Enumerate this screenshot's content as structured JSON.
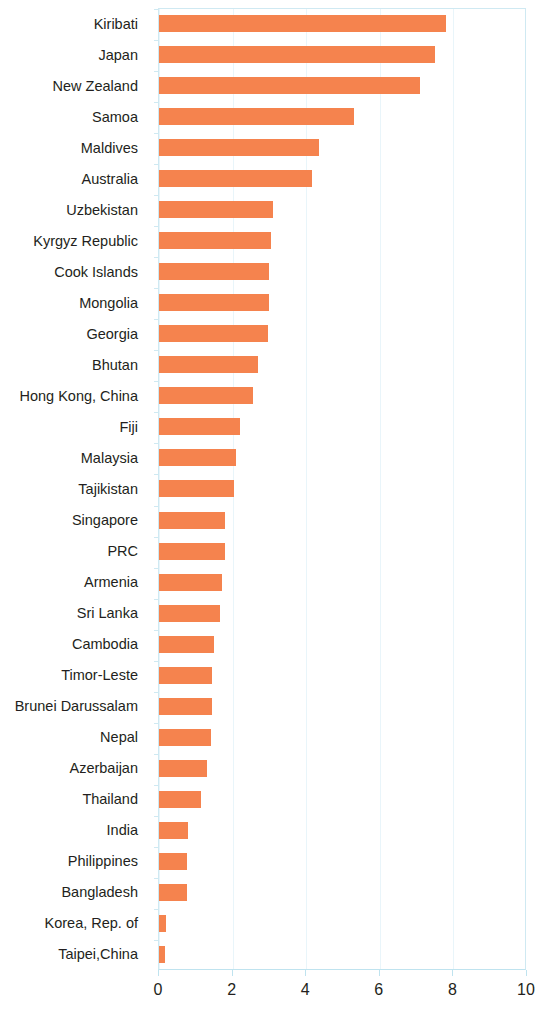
{
  "chart_data": {
    "type": "bar",
    "orientation": "horizontal",
    "title": "",
    "subtitle": "",
    "xlabel": "",
    "ylabel": "",
    "xlim": [
      0,
      10
    ],
    "ylim": null,
    "grid": true,
    "legend": null,
    "xticks": [
      "0",
      "2",
      "4",
      "6",
      "8",
      "10"
    ],
    "xtick_values": [
      0,
      2,
      4,
      6,
      8,
      10
    ],
    "bar_color": "#f5834e",
    "axis_color": "#bfe3ef",
    "grid_color": "#e9f5fa",
    "label_color": "#231f20",
    "categories": [
      "Kiribati",
      "Japan",
      "New Zealand",
      "Samoa",
      "Maldives",
      "Australia",
      "Uzbekistan",
      "Kyrgyz Republic",
      "Cook Islands",
      "Mongolia",
      "Georgia",
      "Bhutan",
      "Hong Kong, China",
      "Fiji",
      "Malaysia",
      "Tajikistan",
      "Singapore",
      "PRC",
      "Armenia",
      "Sri Lanka",
      "Cambodia",
      "Timor-Leste",
      "Brunei Darussalam",
      "Nepal",
      "Azerbaijan",
      "Thailand",
      "India",
      "Philippines",
      "Bangladesh",
      "Korea, Rep. of",
      "Taipei,China"
    ],
    "values": [
      7.8,
      7.5,
      7.1,
      5.3,
      4.35,
      4.15,
      3.1,
      3.05,
      3.0,
      3.0,
      2.95,
      2.7,
      2.55,
      2.2,
      2.1,
      2.05,
      1.8,
      1.8,
      1.7,
      1.65,
      1.5,
      1.45,
      1.45,
      1.4,
      1.3,
      1.15,
      0.8,
      0.75,
      0.75,
      0.2,
      0.15
    ]
  }
}
